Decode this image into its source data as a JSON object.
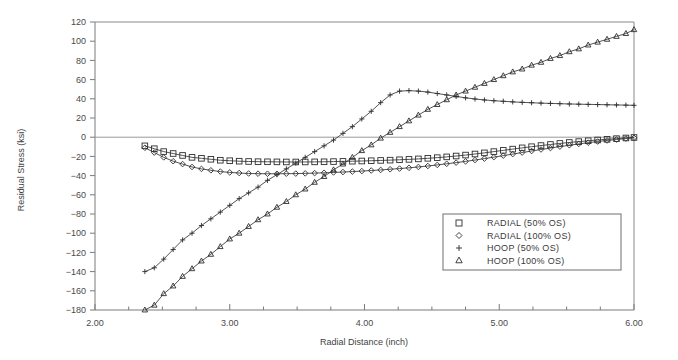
{
  "chart_data": {
    "type": "line",
    "title": "",
    "xlabel": "Radial Distance (inch)",
    "ylabel": "Residual Stress (ksi)",
    "xlim": [
      2.0,
      6.0
    ],
    "ylim": [
      -180,
      120
    ],
    "xticks": [
      2.0,
      3.0,
      4.0,
      5.0,
      6.0
    ],
    "xtick_labels": [
      "2.00",
      "3.00",
      "4.00",
      "5.00",
      "6.00"
    ],
    "xminor_ticks": [
      2.25,
      2.5,
      2.75,
      3.25,
      3.5,
      3.75,
      4.25,
      4.5,
      4.75,
      5.25,
      5.5,
      5.75
    ],
    "yticks": [
      -180,
      -160,
      -140,
      -120,
      -100,
      -80,
      -60,
      -40,
      -20,
      0,
      20,
      40,
      60,
      80,
      100,
      120
    ],
    "ytick_labels": [
      "-180",
      "-160",
      "-140",
      "-120",
      "-100",
      "-80",
      "-60",
      "-40",
      "-20",
      "0",
      "20",
      "40",
      "60",
      "80",
      "100",
      "120"
    ],
    "grid": false,
    "legend_position": "lower-right-inside",
    "zero_reference_line": true,
    "x": [
      2.37,
      2.44,
      2.51,
      2.58,
      2.65,
      2.72,
      2.79,
      2.86,
      2.93,
      3.0,
      3.07,
      3.14,
      3.21,
      3.28,
      3.35,
      3.42,
      3.49,
      3.56,
      3.63,
      3.7,
      3.77,
      3.84,
      3.91,
      3.98,
      4.05,
      4.12,
      4.19,
      4.26,
      4.33,
      4.4,
      4.47,
      4.54,
      4.61,
      4.68,
      4.75,
      4.82,
      4.89,
      4.96,
      5.03,
      5.1,
      5.17,
      5.24,
      5.31,
      5.38,
      5.45,
      5.52,
      5.59,
      5.66,
      5.73,
      5.8,
      5.87,
      5.94,
      6.0
    ],
    "series": [
      {
        "name": "RADIAL (50% OS)",
        "marker": "square",
        "values": [
          -9,
          -12,
          -15,
          -17,
          -19,
          -21,
          -22,
          -23,
          -24,
          -24.5,
          -25,
          -25.3,
          -25.5,
          -25.6,
          -25.7,
          -25.8,
          -25.8,
          -25.8,
          -25.7,
          -25.6,
          -25.4,
          -25.2,
          -25,
          -24.8,
          -24.5,
          -24.2,
          -23.9,
          -23.5,
          -23.1,
          -22.6,
          -22,
          -21.3,
          -20.5,
          -19.6,
          -18.6,
          -17.5,
          -16.3,
          -15,
          -13.7,
          -12.4,
          -11.1,
          -9.9,
          -8.7,
          -7.6,
          -6.5,
          -5.5,
          -4.6,
          -3.7,
          -2.9,
          -2.2,
          -1.5,
          -0.8,
          -0.3
        ]
      },
      {
        "name": "RADIAL (100% OS)",
        "marker": "diamond",
        "values": [
          -11,
          -16,
          -21,
          -25,
          -28,
          -31,
          -33,
          -34.5,
          -35.8,
          -36.7,
          -37.3,
          -37.8,
          -38,
          -38.1,
          -38.1,
          -38,
          -37.9,
          -37.7,
          -37.4,
          -37.1,
          -36.7,
          -36.3,
          -35.8,
          -35.3,
          -34.7,
          -34.1,
          -33.4,
          -32.7,
          -31.9,
          -31,
          -30,
          -28.9,
          -27.7,
          -26.5,
          -25.2,
          -23.8,
          -22.3,
          -20.8,
          -19.2,
          -17.6,
          -16,
          -14.4,
          -12.8,
          -11.3,
          -9.8,
          -8.4,
          -7,
          -5.7,
          -4.5,
          -3.4,
          -2.4,
          -1.4,
          -0.6
        ]
      },
      {
        "name": "HOOP (50% OS)",
        "marker": "plus",
        "values": [
          -140,
          -136,
          -127,
          -117,
          -107,
          -100,
          -92,
          -85,
          -78,
          -71,
          -64,
          -58,
          -52,
          -45,
          -39,
          -33,
          -27,
          -21,
          -15,
          -9,
          -3,
          4,
          11,
          19,
          27,
          36,
          44,
          48,
          48.5,
          48,
          47,
          45.5,
          44,
          42.5,
          41,
          39.8,
          38.8,
          38,
          37.4,
          36.8,
          36.3,
          35.9,
          35.5,
          35.2,
          34.9,
          34.6,
          34.4,
          34.2,
          34,
          33.8,
          33.6,
          33.4,
          33.2
        ]
      },
      {
        "name": "HOOP (100% OS)",
        "marker": "triangle",
        "values": [
          -180,
          -175,
          -163,
          -155,
          -145,
          -137,
          -129,
          -122,
          -114,
          -106,
          -100,
          -93,
          -86,
          -80,
          -73,
          -67,
          -60,
          -54,
          -47,
          -41,
          -34,
          -28,
          -21,
          -14,
          -8,
          -1,
          5,
          11,
          17,
          23,
          29,
          34,
          39,
          44,
          48,
          52,
          56,
          60,
          64,
          68,
          71,
          75,
          78,
          82,
          85,
          89,
          92,
          96,
          99,
          102,
          105,
          108,
          112
        ]
      }
    ]
  },
  "legend": {
    "entries": [
      {
        "marker": "square",
        "label": "RADIAL (50% OS)"
      },
      {
        "marker": "diamond",
        "label": "RADIAL (100% OS)"
      },
      {
        "marker": "plus",
        "label": "HOOP (50% OS)"
      },
      {
        "marker": "triangle",
        "label": "HOOP (100% OS)"
      }
    ]
  },
  "colors": {
    "line": "#404040",
    "axis": "#7a7a7a",
    "text": "#3a3a3a",
    "background": "#ffffff"
  }
}
